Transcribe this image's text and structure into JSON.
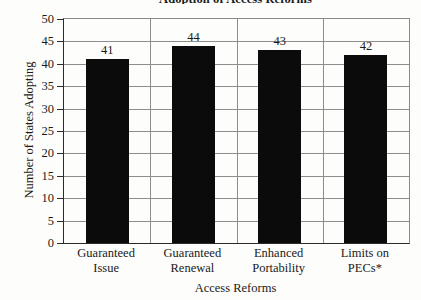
{
  "chart_data": {
    "type": "bar",
    "title": "Adoption of Access Reforms",
    "xlabel": "Access Reforms",
    "ylabel": "Number of States Adopting",
    "categories": [
      "Guaranteed Issue",
      "Guaranteed Renewal",
      "Enhanced Portability",
      "Limits on PECs*"
    ],
    "category_lines": [
      [
        "Guaranteed",
        "Issue"
      ],
      [
        "Guaranteed",
        "Renewal"
      ],
      [
        "Enhanced",
        "Portability"
      ],
      [
        "Limits on",
        "PECs*"
      ]
    ],
    "values": [
      41,
      44,
      43,
      42
    ],
    "value_labels": [
      "41",
      "44",
      "43",
      "42"
    ],
    "ylim": [
      0,
      50
    ],
    "ytick_values": [
      0,
      5,
      10,
      15,
      20,
      25,
      30,
      35,
      40,
      45,
      50
    ],
    "ytick_labels": [
      "0",
      "5",
      "10",
      "15",
      "20",
      "25",
      "30",
      "35",
      "40",
      "45",
      "50"
    ],
    "grid": "horizontal-and-category-dividers",
    "legend": "none",
    "bar_color": "#0b0b0b",
    "grid_color": "#8d8d8d",
    "axis_color": "#2b2b2b",
    "background": "#fdfdfb"
  }
}
